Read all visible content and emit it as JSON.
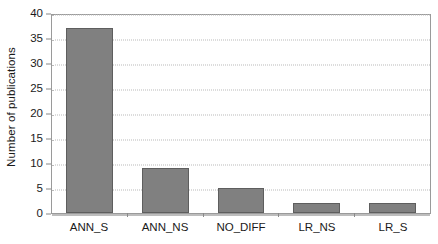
{
  "chart_data": {
    "type": "bar",
    "title": "",
    "subtitle": "",
    "xlabel": "",
    "ylabel": "Number of publications",
    "categories": [
      "ANN_S",
      "ANN_NS",
      "NO_DIFF",
      "LR_NS",
      "LR_S"
    ],
    "values": [
      37,
      9,
      5,
      2,
      2
    ],
    "ylim": [
      0,
      40
    ],
    "ytick_values": [
      0,
      5,
      10,
      15,
      20,
      25,
      30,
      35,
      40
    ],
    "ytick_labels": [
      "0",
      "5",
      "10",
      "15",
      "20",
      "25",
      "30",
      "35",
      "40"
    ],
    "grid": "horizontal-dotted",
    "legend": "none",
    "colors": {
      "bar_fill": "#808080",
      "bar_border": "#5e5e5e",
      "gridline": "#b9b9b9",
      "axis": "#9a9a9a",
      "text": "#1a1a1a",
      "background": "#ffffff"
    }
  }
}
